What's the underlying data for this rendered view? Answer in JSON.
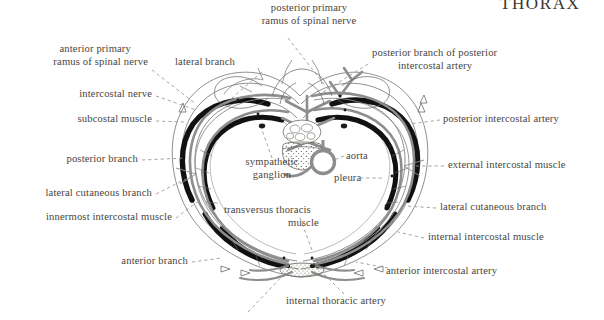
{
  "page": {
    "title": "THORAX",
    "background": "#ffffff",
    "text_color": "#4a4540",
    "ink_black": "#111111",
    "ink_grey": "#8d8d8d",
    "line_thin": "#6f6a64"
  },
  "figure": {
    "name": "transverse-section-of-thorax"
  },
  "labels": {
    "posterior_primary_ramus": "posterior primary\nramus of spinal nerve",
    "posterior_primary_ramus_l1": "posterior primary",
    "posterior_primary_ramus_l2": "ramus of spinal nerve",
    "anterior_primary_ramus_l1": "anterior primary",
    "anterior_primary_ramus_l2": "ramus of spinal nerve",
    "lateral_branch": "lateral branch",
    "intercostal_nerve": "intercostal nerve",
    "subcostal_muscle": "subcostal muscle",
    "posterior_branch": "posterior branch",
    "lateral_cutaneous_branch_left": "lateral cutaneous branch",
    "innermost_intercostal_muscle": "innermost intercostal muscle",
    "anterior_branch": "anterior branch",
    "sympathetic_ganglion_l1": "sympathetic",
    "sympathetic_ganglion_l2": "ganglion",
    "transversus_thoracis_l1": "transversus  thoracis",
    "transversus_thoracis_l2": "muscle",
    "aorta": "aorta",
    "pleura": "pleura",
    "posterior_branch_of_pia_l1": "posterior branch of posterior",
    "posterior_branch_of_pia_l2": "intercostal artery",
    "posterior_intercostal_artery": "posterior intercostal artery",
    "external_intercostal_muscle": "external intercostal muscle",
    "lateral_cutaneous_branch_right": "lateral cutaneous branch",
    "internal_intercostal_muscle": "internal intercostal muscle",
    "anterior_intercostal_artery": "anterior intercostal artery",
    "internal_thoracic_artery": "internal thoracic artery"
  }
}
